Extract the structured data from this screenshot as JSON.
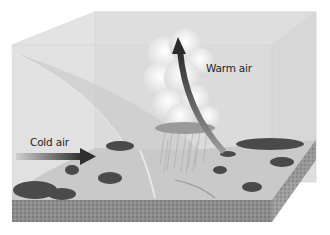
{
  "diagram": {
    "labels": {
      "cold_air": "Cold air",
      "warm_air": "Warm air"
    },
    "arrows": [
      {
        "name": "cold-air-arrow",
        "direction": "right",
        "meaning": "Cold air advancing"
      },
      {
        "name": "warm-air-arrow",
        "direction": "up",
        "meaning": "Warm air rising"
      }
    ],
    "elements": [
      "transparent air block",
      "cumulonimbus cloud",
      "rain",
      "front boundary surface",
      "landscape with trees",
      "soil layer"
    ],
    "colors": {
      "arrow_dark": "#3a3a3a",
      "cloud": "#f4f4f4",
      "sky": "#dcdcdc",
      "ground_light": "#cfcfcf",
      "soil": "#8a8a8a",
      "trees": "#4a4a4a"
    }
  }
}
